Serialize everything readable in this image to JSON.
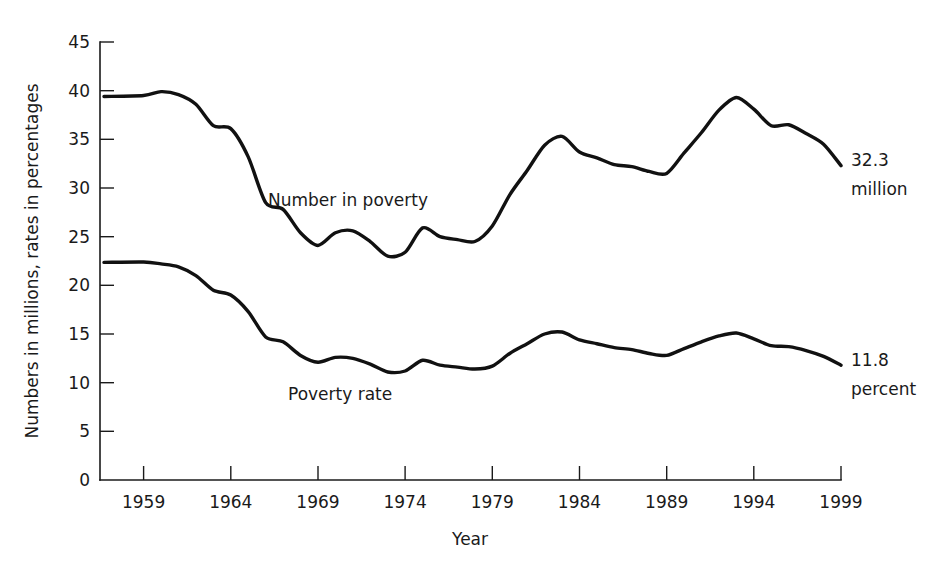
{
  "chart_data": {
    "type": "line",
    "title": "",
    "xlabel": "Year",
    "ylabel": "Numbers in millions, rates in percentages",
    "xlim": [
      1956.5,
      1999
    ],
    "ylim": [
      0,
      45
    ],
    "grid": false,
    "legend_position": "inline-annotations",
    "xticks": [
      1959,
      1964,
      1969,
      1974,
      1979,
      1984,
      1989,
      1994,
      1999
    ],
    "xtick_labels": [
      "1959",
      "1964",
      "1969",
      "1974",
      "1979",
      "1984",
      "1989",
      "1994",
      "1999"
    ],
    "yticks": [
      0,
      5,
      10,
      15,
      20,
      25,
      30,
      35,
      40,
      45
    ],
    "ytick_labels": [
      "0",
      "5",
      "10",
      "15",
      "20",
      "25",
      "30",
      "35",
      "40",
      "45"
    ],
    "x": [
      1959,
      1960,
      1961,
      1962,
      1963,
      1964,
      1965,
      1966,
      1967,
      1968,
      1969,
      1970,
      1971,
      1972,
      1973,
      1974,
      1975,
      1976,
      1977,
      1978,
      1979,
      1980,
      1981,
      1982,
      1983,
      1984,
      1985,
      1986,
      1987,
      1988,
      1989,
      1990,
      1991,
      1992,
      1993,
      1994,
      1995,
      1996,
      1997,
      1998,
      1999
    ],
    "series": [
      {
        "name": "Number in poverty",
        "unit": "million",
        "annotation": "32.3 million",
        "end_value": 32.3,
        "values": [
          39.5,
          39.9,
          39.6,
          38.6,
          36.4,
          36.1,
          33.2,
          28.5,
          27.8,
          25.4,
          24.1,
          25.4,
          25.6,
          24.5,
          23.0,
          23.4,
          25.9,
          25.0,
          24.7,
          24.5,
          26.1,
          29.3,
          31.8,
          34.4,
          35.3,
          33.7,
          33.1,
          32.4,
          32.2,
          31.7,
          31.5,
          33.6,
          35.7,
          38.0,
          39.3,
          38.1,
          36.4,
          36.5,
          35.6,
          34.5,
          32.3
        ]
      },
      {
        "name": "Poverty rate",
        "unit": "percent",
        "annotation": "11.8 percent",
        "end_value": 11.8,
        "values": [
          22.4,
          22.2,
          21.9,
          21.0,
          19.5,
          19.0,
          17.3,
          14.7,
          14.2,
          12.8,
          12.1,
          12.6,
          12.5,
          11.9,
          11.1,
          11.2,
          12.3,
          11.8,
          11.6,
          11.4,
          11.7,
          13.0,
          14.0,
          15.0,
          15.2,
          14.4,
          14.0,
          13.6,
          13.4,
          13.0,
          12.8,
          13.5,
          14.2,
          14.8,
          15.1,
          14.5,
          13.8,
          13.7,
          13.3,
          12.7,
          11.8
        ]
      }
    ],
    "annotations": [
      {
        "text": "Number in poverty",
        "x": 1969.0,
        "y": 28.8
      },
      {
        "text": "Poverty rate",
        "x": 1970.2,
        "y": 8.6
      },
      {
        "text": "32.3",
        "x": 1999.3,
        "y": 31.2
      },
      {
        "text": "million",
        "x": 1999.3,
        "y": 27.5
      },
      {
        "text": "11.8",
        "x": 1999.3,
        "y": 10.7
      },
      {
        "text": "percent",
        "x": 1999.3,
        "y": 7.0
      }
    ]
  },
  "labels": {
    "y_axis_title": "Numbers in millions, rates in percentages",
    "x_axis_title": "Year",
    "series_number_label": "Number in poverty",
    "series_rate_label": "Poverty rate",
    "end_number_value": "32.3",
    "end_number_unit": "million",
    "end_rate_value": "11.8",
    "end_rate_unit": "percent",
    "ytick_0": "0",
    "ytick_5": "5",
    "ytick_10": "10",
    "ytick_15": "15",
    "ytick_20": "20",
    "ytick_25": "25",
    "ytick_30": "30",
    "ytick_35": "35",
    "ytick_40": "40",
    "ytick_45": "45",
    "xtick_1959": "1959",
    "xtick_1964": "1964",
    "xtick_1969": "1969",
    "xtick_1974": "1974",
    "xtick_1979": "1979",
    "xtick_1984": "1984",
    "xtick_1989": "1989",
    "xtick_1994": "1994",
    "xtick_1999": "1999"
  },
  "colors": {
    "line": "#111111",
    "text": "#1a1a1a",
    "background": "#ffffff"
  }
}
